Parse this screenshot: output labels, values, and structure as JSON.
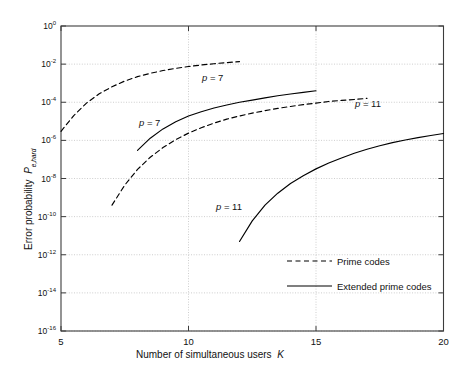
{
  "chart_data": {
    "type": "line",
    "title": "",
    "xlabel": "Number of simultaneous users   K",
    "xlabel_main": "Number of simultaneous users",
    "xlabel_symbol": "K",
    "ylabel_main": "Error probability",
    "ylabel_symbol": "P",
    "ylabel_subscript": "e,hard",
    "ylabel": "Error probability  P e,hard",
    "xlim": [
      5,
      20
    ],
    "ylim": [
      1e-16,
      1
    ],
    "yscale": "log",
    "xscale": "linear",
    "xticks": [
      5,
      10,
      15,
      20
    ],
    "xtick_labels": [
      "5",
      "10",
      "15",
      "20"
    ],
    "yticks": [
      1,
      0.01,
      0.0001,
      1e-06,
      1e-08,
      1e-10,
      1e-12,
      1e-14,
      1e-16
    ],
    "ytick_labels": [
      "10⁰",
      "10⁻²",
      "10⁻⁴",
      "10⁻⁶",
      "10⁻⁸",
      "10⁻¹⁰",
      "10⁻¹²",
      "10⁻¹⁴",
      "10⁻¹⁶"
    ],
    "ytick_mantissa": "10",
    "ytick_exponents": [
      "0",
      "-2",
      "-4",
      "-6",
      "-8",
      "-10",
      "-12",
      "-14",
      "-16"
    ],
    "grid": true,
    "grid_style": "dotted",
    "legend_position": "lower right",
    "series": [
      {
        "name": "Prime codes, p = 7",
        "style": "dashed",
        "color": "#000000",
        "points": [
          [
            5.0,
            3e-06
          ],
          [
            5.5,
            2e-05
          ],
          [
            6.0,
            9e-05
          ],
          [
            6.5,
            0.00028
          ],
          [
            7.0,
            0.00065
          ],
          [
            7.5,
            0.0013
          ],
          [
            8.0,
            0.0022
          ],
          [
            8.5,
            0.0033
          ],
          [
            9.0,
            0.0046
          ],
          [
            9.5,
            0.006
          ],
          [
            10.0,
            0.0075
          ],
          [
            10.5,
            0.009
          ],
          [
            11.0,
            0.0105
          ],
          [
            11.5,
            0.012
          ],
          [
            12.0,
            0.0135
          ]
        ]
      },
      {
        "name": "Extended prime codes, p = 7",
        "style": "solid",
        "color": "#000000",
        "points": [
          [
            8.0,
            3e-07
          ],
          [
            8.5,
            1.3e-06
          ],
          [
            9.0,
            4e-06
          ],
          [
            9.5,
            9.5e-06
          ],
          [
            10.0,
            1.9e-05
          ],
          [
            10.5,
            3.2e-05
          ],
          [
            11.0,
            5e-05
          ],
          [
            11.5,
            7.2e-05
          ],
          [
            12.0,
            0.0001
          ],
          [
            12.5,
            0.00013
          ],
          [
            13.0,
            0.00017
          ],
          [
            13.5,
            0.00022
          ],
          [
            14.0,
            0.00027
          ],
          [
            14.5,
            0.00033
          ],
          [
            15.0,
            0.0004
          ]
        ]
      },
      {
        "name": "Prime codes, p = 11",
        "style": "dashed",
        "color": "#000000",
        "points": [
          [
            7.0,
            4e-10
          ],
          [
            7.5,
            4.5e-09
          ],
          [
            8.0,
            3e-08
          ],
          [
            8.5,
            1.3e-07
          ],
          [
            9.0,
            4.2e-07
          ],
          [
            9.5,
            1.1e-06
          ],
          [
            10.0,
            2.4e-06
          ],
          [
            10.5,
            4.6e-06
          ],
          [
            11.0,
            8e-06
          ],
          [
            11.5,
            1.3e-05
          ],
          [
            12.0,
            1.9e-05
          ],
          [
            12.5,
            2.7e-05
          ],
          [
            13.0,
            3.6e-05
          ],
          [
            13.5,
            4.8e-05
          ],
          [
            14.0,
            6e-05
          ],
          [
            14.5,
            7.5e-05
          ],
          [
            15.0,
            9e-05
          ],
          [
            15.5,
            0.00011
          ],
          [
            16.0,
            0.000125
          ],
          [
            16.5,
            0.00014
          ],
          [
            17.0,
            0.00016
          ]
        ]
      },
      {
        "name": "Extended prime codes, p = 11",
        "style": "solid",
        "color": "#000000",
        "points": [
          [
            12.0,
            5e-12
          ],
          [
            12.5,
            6e-11
          ],
          [
            13.0,
            4e-10
          ],
          [
            13.5,
            1.7e-09
          ],
          [
            14.0,
            5.5e-09
          ],
          [
            14.5,
            1.4e-08
          ],
          [
            15.0,
            3.2e-08
          ],
          [
            15.5,
            6.5e-08
          ],
          [
            16.0,
            1.2e-07
          ],
          [
            16.5,
            2.1e-07
          ],
          [
            17.0,
            3.4e-07
          ],
          [
            17.5,
            5.2e-07
          ],
          [
            18.0,
            7.6e-07
          ],
          [
            18.5,
            1.05e-06
          ],
          [
            19.0,
            1.4e-06
          ],
          [
            19.5,
            1.8e-06
          ],
          [
            20.0,
            2.3e-06
          ]
        ]
      }
    ],
    "annotations": [
      {
        "text_symbol": "p",
        "text_rest": " = 7",
        "label": "p = 7",
        "x": 11.0,
        "y": 0.002,
        "px": 202,
        "py": 72
      },
      {
        "text_symbol": "p",
        "text_rest": " = 7",
        "label": "p = 7",
        "x": 8.3,
        "y": 3e-06,
        "px": 139,
        "py": 117
      },
      {
        "text_symbol": "p",
        "text_rest": " = 11",
        "label": "p = 11",
        "x": 17.0,
        "y": 9e-05,
        "px": 355,
        "py": 98
      },
      {
        "text_symbol": "p",
        "text_rest": " = 11",
        "label": "p = 11",
        "x": 12.5,
        "y": 2e-10,
        "px": 216,
        "py": 201
      }
    ],
    "legend": [
      {
        "label": "Prime codes",
        "style": "dashed"
      },
      {
        "label": "Extended prime codes",
        "style": "solid"
      }
    ]
  }
}
